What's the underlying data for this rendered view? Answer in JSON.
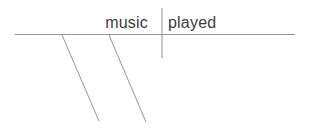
{
  "diagram": {
    "type": "sentence-diagram",
    "subject": "music",
    "verb": "played",
    "colors": {
      "line": "#949494",
      "text": "#3c3c3c"
    }
  }
}
